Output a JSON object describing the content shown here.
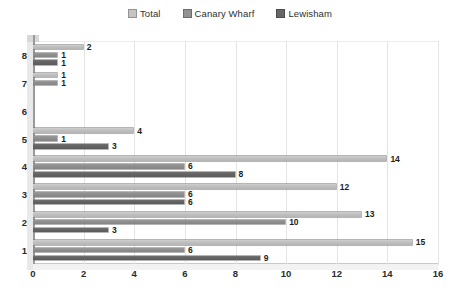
{
  "legend": {
    "position": "top-center",
    "items": [
      {
        "label": "Total",
        "color": "#c4c4c4",
        "icon": "legend-swatch-icon"
      },
      {
        "label": "Canary Wharf",
        "color": "#919191",
        "icon": "legend-swatch-icon"
      },
      {
        "label": "Lewisham",
        "color": "#666666",
        "icon": "legend-swatch-icon"
      }
    ]
  },
  "axes": {
    "x_ticks": [
      "0",
      "2",
      "4",
      "6",
      "8",
      "10",
      "12",
      "14",
      "16"
    ],
    "y_ticks": [
      "8",
      "7",
      "6",
      "5",
      "4",
      "3",
      "2",
      "1"
    ]
  },
  "chart_data": {
    "type": "bar",
    "orientation": "horizontal",
    "grouped": true,
    "title": "",
    "xlabel": "",
    "ylabel": "",
    "xlim": [
      0,
      16
    ],
    "xtick_step": 2,
    "grid": true,
    "legend_position": "top-center",
    "categories": [
      "8",
      "7",
      "6",
      "5",
      "4",
      "3",
      "2",
      "1"
    ],
    "series": [
      {
        "name": "Total",
        "color": "#c4c4c4",
        "values": [
          2,
          1,
          0,
          4,
          14,
          12,
          13,
          15
        ]
      },
      {
        "name": "Canary Wharf",
        "color": "#919191",
        "values": [
          1,
          1,
          0,
          1,
          6,
          6,
          10,
          6
        ]
      },
      {
        "name": "Lewisham",
        "color": "#666666",
        "values": [
          1,
          0,
          0,
          3,
          8,
          6,
          3,
          9
        ]
      }
    ],
    "data_labels": {
      "8": {
        "Total": "2",
        "Canary Wharf": "1",
        "Lewisham": "1"
      },
      "7": {
        "Total": "1",
        "Canary Wharf": "1",
        "Lewisham": ""
      },
      "6": {
        "Total": "",
        "Canary Wharf": "",
        "Lewisham": ""
      },
      "5": {
        "Total": "4",
        "Canary Wharf": "1",
        "Lewisham": "3"
      },
      "4": {
        "Total": "14",
        "Canary Wharf": "6",
        "Lewisham": "8"
      },
      "3": {
        "Total": "12",
        "Canary Wharf": "6",
        "Lewisham": "6"
      },
      "2": {
        "Total": "13",
        "Canary Wharf": "10",
        "Lewisham": "3"
      },
      "1": {
        "Total": "15",
        "Canary Wharf": "6",
        "Lewisham": "9"
      }
    }
  }
}
